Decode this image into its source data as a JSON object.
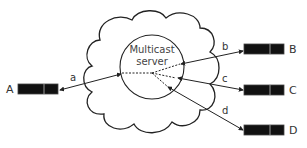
{
  "diagram": {
    "server": {
      "line1": "Multicast",
      "line2": "server"
    },
    "nodes": [
      {
        "id": "A",
        "label": "A"
      },
      {
        "id": "B",
        "label": "B"
      },
      {
        "id": "C",
        "label": "C"
      },
      {
        "id": "D",
        "label": "D"
      }
    ],
    "links": [
      {
        "label": "a",
        "from": "A"
      },
      {
        "label": "b",
        "from": "B"
      },
      {
        "label": "c",
        "from": "C"
      },
      {
        "label": "d",
        "from": "D"
      }
    ],
    "colors": {
      "stroke": "#222222",
      "device": "#111111",
      "text": "#333333"
    }
  }
}
